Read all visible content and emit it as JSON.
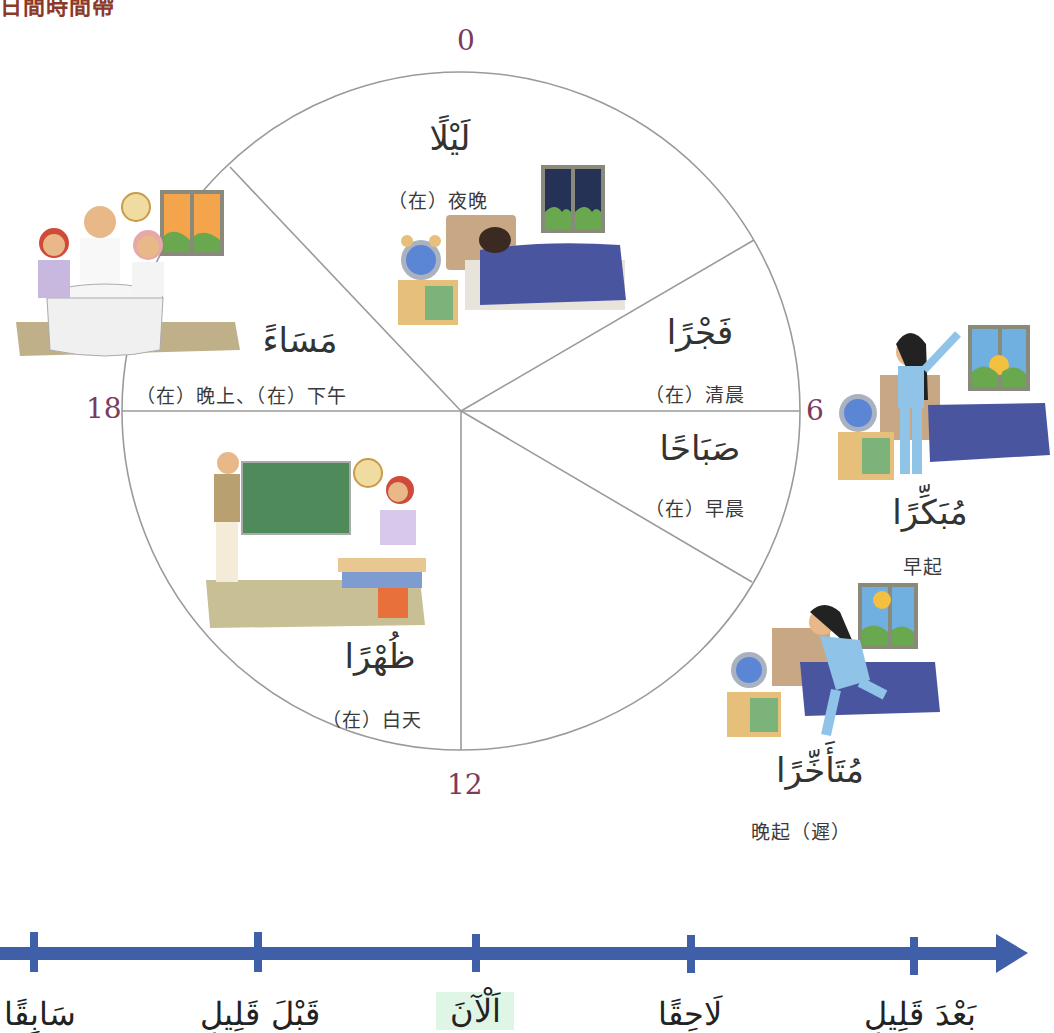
{
  "header": {
    "title": "日間時間帶"
  },
  "clock": {
    "hours": {
      "top": "0",
      "right": "6",
      "bottom": "12",
      "left": "18"
    },
    "colors": {
      "line": "#9a9a9a",
      "hour_label": "#7a3b5e"
    }
  },
  "segments": [
    {
      "id": "night",
      "arabic": "لَيْلًا",
      "chinese": "（在）夜晚"
    },
    {
      "id": "dawn",
      "arabic": "فَجْرًا",
      "chinese": "（在）清晨"
    },
    {
      "id": "morning",
      "arabic": "صَبَاحًا",
      "chinese": "（在）早晨"
    },
    {
      "id": "noon",
      "arabic": "ظُهْرًا",
      "chinese": "（在）白天"
    },
    {
      "id": "evening",
      "arabic": "مَسَاءً",
      "chinese": "（在）晚上、（在）下午"
    }
  ],
  "side_items": [
    {
      "id": "early",
      "arabic": "مُبَكِّرًا",
      "chinese": "早起"
    },
    {
      "id": "late",
      "arabic": "مُتَأَخِّرًا",
      "chinese": "晚起（遲）"
    }
  ],
  "timeline": {
    "color": "#3f5fa8",
    "now_highlight": "#dff5e6",
    "labels": [
      {
        "id": "previously",
        "arabic": "سَابِقًا"
      },
      {
        "id": "shortly-before",
        "arabic": "قَبْلَ قَلِيلٍ"
      },
      {
        "id": "now",
        "arabic": "اَلْآنَ"
      },
      {
        "id": "later",
        "arabic": "لَاحِقًا"
      },
      {
        "id": "shortly-after",
        "arabic": "بَعْدَ قَلِيلٍ"
      }
    ]
  }
}
